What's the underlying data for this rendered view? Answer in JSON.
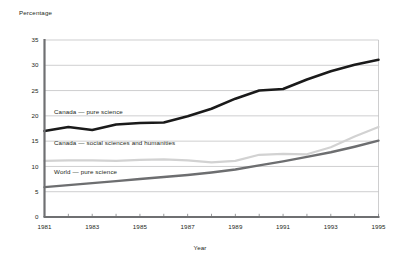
{
  "chart_data": {
    "type": "line",
    "title": "",
    "xlabel": "Year",
    "ylabel": "Percentage",
    "ylim": [
      0,
      35
    ],
    "xlim": [
      1981,
      1995
    ],
    "ytick_values": [
      0,
      5,
      10,
      15,
      20,
      25,
      30,
      35
    ],
    "ytick_labels": [
      "0",
      "5",
      "10",
      "15",
      "20",
      "25",
      "30",
      "35"
    ],
    "xtick_values": [
      1981,
      1983,
      1985,
      1987,
      1989,
      1991,
      1993,
      1995
    ],
    "xtick_labels": [
      "1981",
      "1983",
      "1985",
      "1987",
      "1989",
      "1991",
      "1993",
      "1995"
    ],
    "x": [
      1981,
      1982,
      1983,
      1984,
      1985,
      1986,
      1987,
      1988,
      1989,
      1990,
      1991,
      1992,
      1993,
      1994,
      1995
    ],
    "grid": true,
    "legend_position": "inline-labels",
    "series": [
      {
        "name": "Canada — pure science",
        "color": "#1a1a1a",
        "width": 2.6,
        "values": [
          17.0,
          17.8,
          17.2,
          18.3,
          18.6,
          18.7,
          19.9,
          21.4,
          23.4,
          25.0,
          25.3,
          27.2,
          28.8,
          30.1,
          31.1
        ],
        "label_x": 1981.4,
        "label_y": 20.3
      },
      {
        "name": "Canada — social sciences and humanities",
        "color": "#d2d2d2",
        "width": 2.2,
        "values": [
          11.1,
          11.2,
          11.2,
          11.1,
          11.3,
          11.4,
          11.2,
          10.8,
          11.1,
          12.3,
          12.5,
          12.4,
          13.8,
          15.9,
          17.8
        ],
        "label_x": 1981.4,
        "label_y": 14.2
      },
      {
        "name": "World — pure science",
        "color": "#6d6e70",
        "width": 2.4,
        "values": [
          5.9,
          6.3,
          6.7,
          7.1,
          7.5,
          7.9,
          8.3,
          8.8,
          9.4,
          10.2,
          11.0,
          11.9,
          12.8,
          13.9,
          15.1
        ],
        "label_x": 1981.4,
        "label_y": 8.5
      }
    ]
  }
}
